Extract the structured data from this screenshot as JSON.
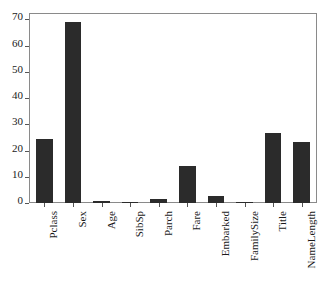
{
  "chart_data": {
    "type": "bar",
    "title": "",
    "subtitle": "",
    "xlabel": "",
    "ylabel": "",
    "categories": [
      "Pclass",
      "Sex",
      "Age",
      "SibSp",
      "Parch",
      "Fare",
      "Embarked",
      "FamilySize",
      "Title",
      "NameLength"
    ],
    "values": [
      24.5,
      68.8,
      0.9,
      0.5,
      1.7,
      14.0,
      2.5,
      0.2,
      26.7,
      23.3
    ],
    "ylim": [
      0,
      72
    ],
    "ytick_labels": [
      "0",
      "10",
      "20",
      "30",
      "40",
      "50",
      "60",
      "70"
    ],
    "ytick_values": [
      0,
      10,
      20,
      30,
      40,
      50,
      60,
      70
    ],
    "grid": false,
    "legend": null,
    "bar_color": "#2b2b2b",
    "frame_color": "#8a8a8a",
    "background_color": "#ffffff",
    "annotations": []
  }
}
